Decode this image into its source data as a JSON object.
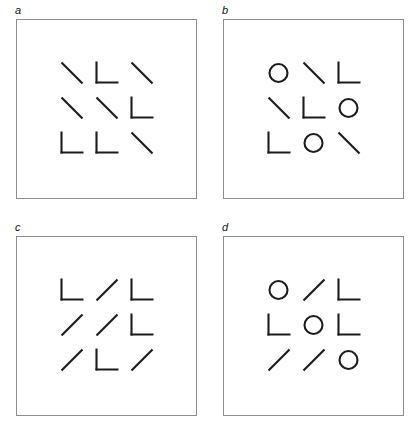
{
  "figure": {
    "title": "",
    "panel_count": 4,
    "stroke_color": "#1c1c1c",
    "frame_color": "#8d8d8d",
    "background_color": "#ffffff"
  },
  "panels": [
    {
      "label": "a",
      "name": "panel-a",
      "grid_rows": 3,
      "grid_cols": 3,
      "glyphs": [
        "backslash",
        "ell",
        "backslash",
        "backslash",
        "backslash",
        "ell",
        "ell",
        "ell",
        "backslash"
      ]
    },
    {
      "label": "b",
      "name": "panel-b",
      "grid_rows": 3,
      "grid_cols": 3,
      "glyphs": [
        "circle",
        "backslash",
        "ell",
        "backslash",
        "ell",
        "circle",
        "ell",
        "circle",
        "backslash"
      ]
    },
    {
      "label": "c",
      "name": "panel-c",
      "grid_rows": 3,
      "grid_cols": 3,
      "glyphs": [
        "ell",
        "slash",
        "ell",
        "slash",
        "slash",
        "ell",
        "slash",
        "ell",
        "slash"
      ]
    },
    {
      "label": "d",
      "name": "panel-d",
      "grid_rows": 3,
      "grid_cols": 3,
      "glyphs": [
        "circle",
        "slash",
        "ell",
        "ell",
        "circle",
        "ell",
        "slash",
        "slash",
        "circle"
      ]
    }
  ]
}
